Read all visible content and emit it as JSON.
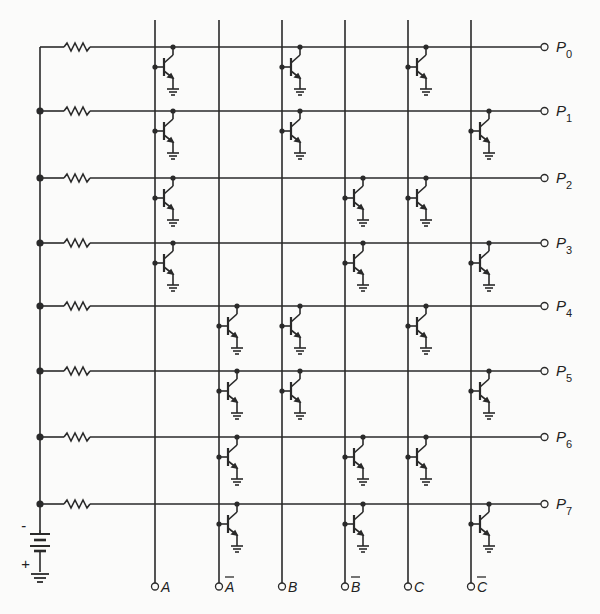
{
  "diagram": {
    "type": "transistor decoder matrix (3-to-8 line decoder)",
    "inputs": [
      {
        "id": "A",
        "label": "A",
        "bar": false
      },
      {
        "id": "A_bar",
        "label": "A",
        "bar": true
      },
      {
        "id": "B",
        "label": "B",
        "bar": false
      },
      {
        "id": "B_bar",
        "label": "B",
        "bar": true
      },
      {
        "id": "C",
        "label": "C",
        "bar": false
      },
      {
        "id": "C_bar",
        "label": "C",
        "bar": true
      }
    ],
    "outputs": [
      {
        "label": "P",
        "sub": "0",
        "transistors_on": [
          "A",
          "B",
          "C"
        ]
      },
      {
        "label": "P",
        "sub": "1",
        "transistors_on": [
          "A",
          "B",
          "C_bar"
        ]
      },
      {
        "label": "P",
        "sub": "2",
        "transistors_on": [
          "A",
          "B_bar",
          "C"
        ]
      },
      {
        "label": "P",
        "sub": "3",
        "transistors_on": [
          "A",
          "B_bar",
          "C_bar"
        ]
      },
      {
        "label": "P",
        "sub": "4",
        "transistors_on": [
          "A_bar",
          "B",
          "C"
        ]
      },
      {
        "label": "P",
        "sub": "5",
        "transistors_on": [
          "A_bar",
          "B",
          "C_bar"
        ]
      },
      {
        "label": "P",
        "sub": "6",
        "transistors_on": [
          "A_bar",
          "B_bar",
          "C"
        ]
      },
      {
        "label": "P",
        "sub": "7",
        "transistors_on": [
          "A_bar",
          "B_bar",
          "C_bar"
        ]
      }
    ],
    "battery": {
      "minus_label": "-",
      "plus_label": "+"
    },
    "colors": {
      "line": "#2a2a2a",
      "background": "#fbfbfa"
    }
  }
}
